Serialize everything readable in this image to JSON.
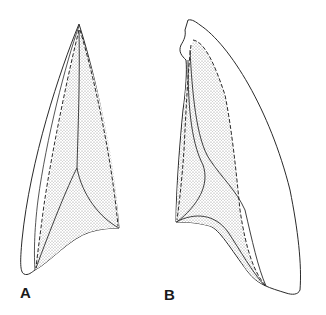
{
  "figure": {
    "panels": [
      {
        "id": "A",
        "label": "A",
        "description": "leaf-shaped outline, narrow pointed apex, with stippled inner region bounded by dashed line and internal solid curves"
      },
      {
        "id": "B",
        "label": "B",
        "description": "broader curved outline with irregular notched apex, stippled inner region bounded by dashed line and internal solid curves"
      }
    ],
    "colors": {
      "stroke": "#2a2a2a",
      "stipple": "#9a9a9a",
      "background": "#ffffff"
    }
  }
}
